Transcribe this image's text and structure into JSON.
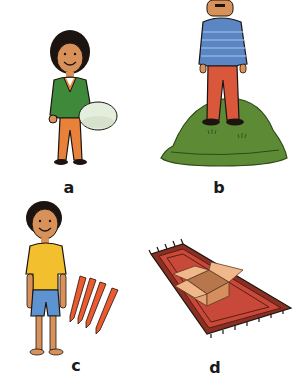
{
  "panels": [
    {
      "label": "a",
      "description": "girl in green sweater and orange trousers holding a large egg"
    },
    {
      "label": "b",
      "description": "man in blue striped sweater and red trousers standing on a green hill"
    },
    {
      "label": "c",
      "description": "boy in yellow t-shirt and blue shorts next to four red pens"
    },
    {
      "label": "d",
      "description": "open cardboard box on a red patterned rug with fringes"
    }
  ],
  "colors": {
    "skin": "#d9915a",
    "hair": "#1c1410",
    "green_sweater": "#3e8a3a",
    "orange_trousers": "#e8823a",
    "egg": "#e4eedd",
    "blue_sweater": "#5b86c4",
    "red_trousers": "#d9573a",
    "hill": "#5d8a34",
    "yellow_shirt": "#f2c02e",
    "blue_shorts": "#5d93d0",
    "pen": "#ec5a2e",
    "rug": "#c8493a",
    "rug_border": "#8a2f22",
    "box": "#e8a374"
  }
}
